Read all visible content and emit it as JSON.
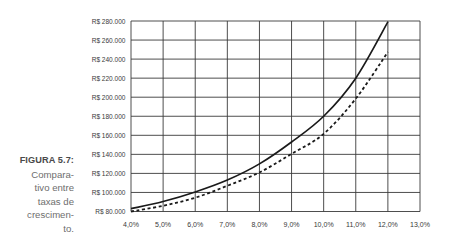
{
  "figure": {
    "label": "FIGURA 5.7:",
    "caption_lines": [
      "Compara-",
      "tivo entre",
      "taxas de",
      "crescimen-",
      "to."
    ]
  },
  "colors": {
    "grid": "#3a3a3a",
    "line": "#1a1a1a",
    "caption_label": "#4a4a4a",
    "caption_text": "#6e6e6e"
  },
  "chart_data": {
    "type": "line",
    "title": "",
    "xlabel": "",
    "ylabel": "",
    "x": [
      4.0,
      5.0,
      6.0,
      7.0,
      8.0,
      9.0,
      10.0,
      11.0,
      12.0
    ],
    "xlim": [
      4.0,
      13.0
    ],
    "ylim": [
      80000,
      280000
    ],
    "x_ticks": [
      4.0,
      5.0,
      6.0,
      7.0,
      8.0,
      9.0,
      10.0,
      11.0,
      12.0,
      13.0
    ],
    "x_tick_labels": [
      "4,0%",
      "5,0%",
      "6,0%",
      "7,0%",
      "8,0%",
      "9,0%",
      "10,0%",
      "11,0%",
      "12,0%",
      "13,0%"
    ],
    "y_ticks": [
      80000,
      100000,
      120000,
      140000,
      160000,
      180000,
      200000,
      220000,
      240000,
      260000,
      280000
    ],
    "y_tick_labels": [
      "R$ 80.000",
      "R$ 100.000",
      "R$ 120.000",
      "R$ 140.000",
      "R$ 160.000",
      "R$ 180.000",
      "R$ 200.000",
      "R$ 220.000",
      "R$ 240.000",
      "R$ 260.000",
      "R$ 280.000"
    ],
    "grid": true,
    "legend": null,
    "series": [
      {
        "name": "solid",
        "line_style": "solid",
        "values": [
          83000,
          90500,
          100500,
          113000,
          130000,
          153000,
          180000,
          220000,
          279000
        ]
      },
      {
        "name": "dashed",
        "line_style": "dashed",
        "values": [
          80000,
          86000,
          94500,
          107000,
          121000,
          140500,
          161500,
          198500,
          247500
        ]
      }
    ]
  }
}
